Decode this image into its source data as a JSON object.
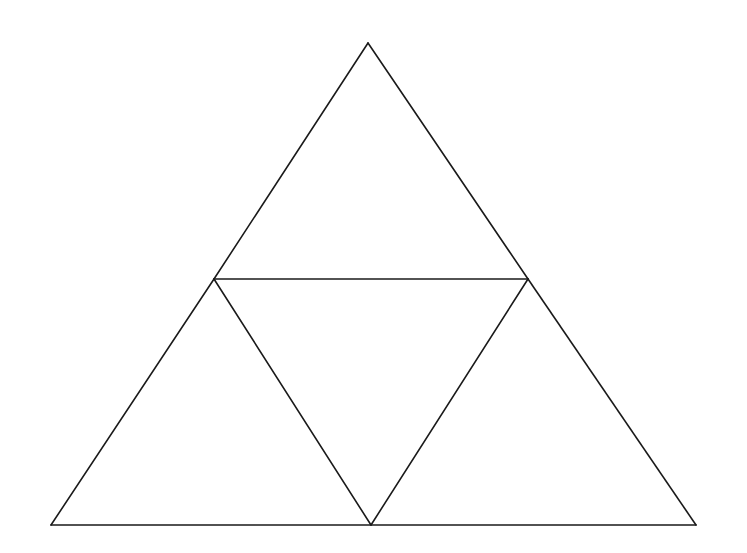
{
  "diagram": {
    "title": "",
    "stroke_color": "#1a1a1a",
    "background_color": "#ffffff",
    "vertices": {
      "top": [
        368,
        43
      ],
      "mid_left": [
        214,
        279
      ],
      "mid_right": [
        528,
        279
      ],
      "bottom_left": [
        51,
        525
      ],
      "bottom_mid": [
        371,
        525
      ],
      "bottom_right": [
        696,
        525
      ]
    },
    "segments": [
      {
        "name": "outer-left-edge-upper",
        "from": [
          368,
          43
        ],
        "to": [
          214,
          279
        ]
      },
      {
        "name": "outer-left-edge-lower",
        "from": [
          214,
          279
        ],
        "to": [
          51,
          525
        ]
      },
      {
        "name": "outer-right-edge-upper",
        "from": [
          368,
          43
        ],
        "to": [
          528,
          279
        ]
      },
      {
        "name": "outer-right-edge-lower",
        "from": [
          528,
          279
        ],
        "to": [
          696,
          525
        ]
      },
      {
        "name": "base-edge",
        "from": [
          51,
          525
        ],
        "to": [
          696,
          525
        ]
      },
      {
        "name": "midline-horizontal",
        "from": [
          214,
          279
        ],
        "to": [
          528,
          279
        ]
      },
      {
        "name": "inner-left-diagonal",
        "from": [
          214,
          279
        ],
        "to": [
          371,
          525
        ]
      },
      {
        "name": "inner-right-diagonal",
        "from": [
          528,
          279
        ],
        "to": [
          371,
          525
        ]
      }
    ],
    "triangles": [
      {
        "name": "top-triangle",
        "points": [
          [
            368,
            43
          ],
          [
            214,
            279
          ],
          [
            528,
            279
          ]
        ]
      },
      {
        "name": "bottom-left-triangle",
        "points": [
          [
            214,
            279
          ],
          [
            51,
            525
          ],
          [
            371,
            525
          ]
        ]
      },
      {
        "name": "center-inverted-triangle",
        "points": [
          [
            214,
            279
          ],
          [
            528,
            279
          ],
          [
            371,
            525
          ]
        ]
      },
      {
        "name": "bottom-right-triangle",
        "points": [
          [
            528,
            279
          ],
          [
            371,
            525
          ],
          [
            696,
            525
          ]
        ]
      }
    ]
  }
}
